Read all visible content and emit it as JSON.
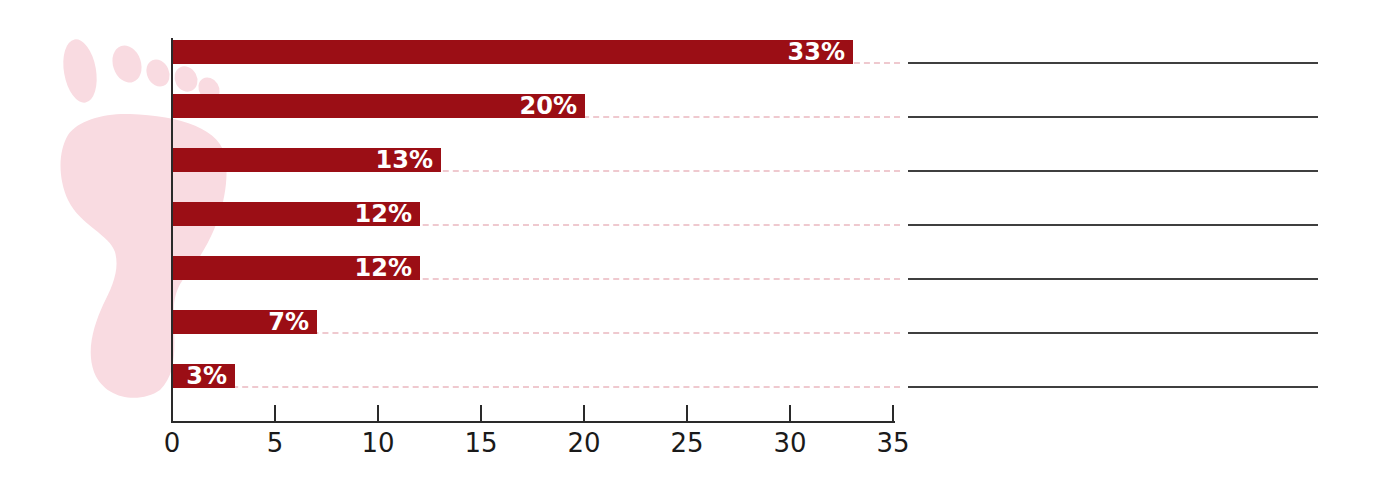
{
  "chart_data": {
    "type": "bar",
    "orientation": "horizontal",
    "title": "",
    "xlabel": "",
    "ylabel": "",
    "xlim": [
      0,
      35
    ],
    "x_ticks": [
      "0",
      "5",
      "10",
      "15",
      "20",
      "25",
      "30",
      "35"
    ],
    "categories": [
      "",
      "",
      "",
      "",
      "",
      "",
      ""
    ],
    "values": [
      33,
      20,
      13,
      12,
      12,
      7,
      3
    ],
    "bar_labels": [
      "33%",
      "20%",
      "13%",
      "12%",
      "12%",
      "7%",
      "3%"
    ],
    "legend": "none",
    "grid": "dashed pink guide at each bar baseline extending to answer blanks"
  },
  "answer_blanks": {
    "count": 7,
    "description": "blank ruled lines to the right of the chart, one per bar, for writing answers"
  },
  "watermark": {
    "name": "footprint",
    "description": "light pink footprint graphic behind the chart's left side"
  },
  "colors": {
    "bar": "#9b0e15",
    "bar_label": "#ffffff",
    "guide_dash": "#efc9cf",
    "answer_line": "#3f3f3f",
    "axis": "#2a2a2a",
    "tick_label": "#1a1a1a",
    "footprint": "#f9dbe1",
    "background": "#ffffff"
  }
}
